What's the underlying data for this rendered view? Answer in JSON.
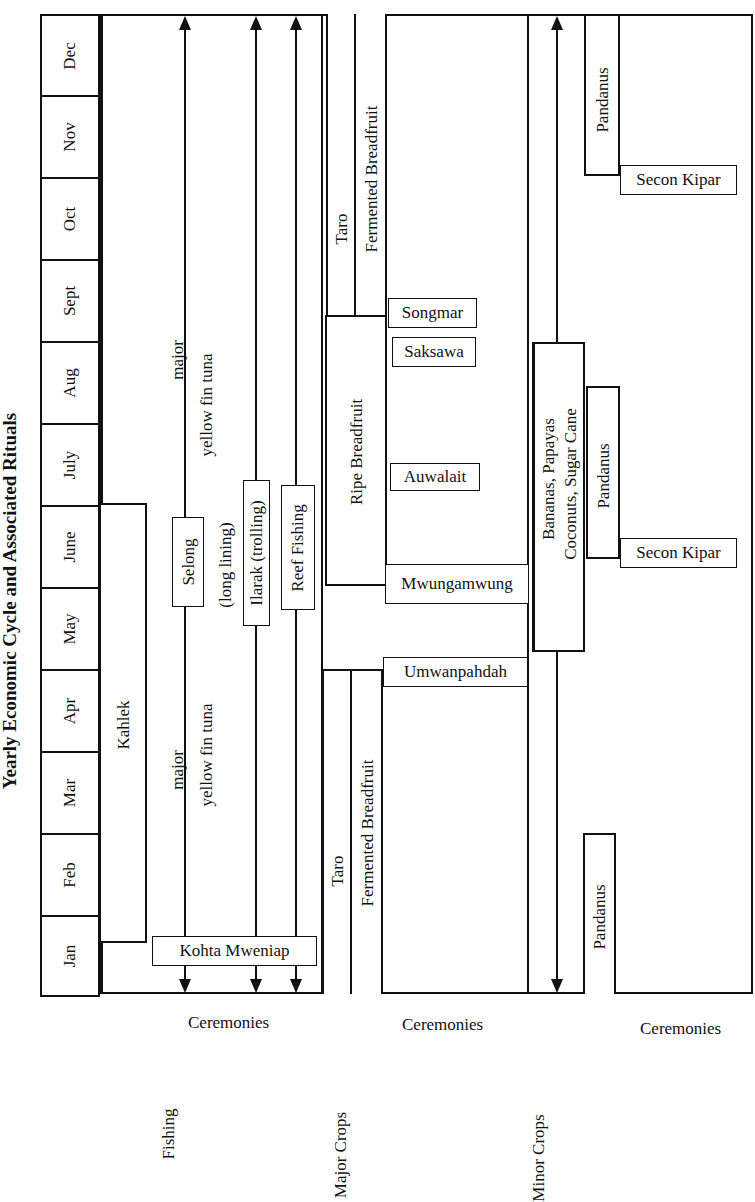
{
  "title": "Yearly Economic Cycle and Associated Rituals",
  "months": [
    "Dec",
    "Nov",
    "Oct",
    "Sept",
    "Aug",
    "July",
    "June",
    "May",
    "Apr",
    "Mar",
    "Feb",
    "Jan"
  ],
  "sections": {
    "fishing": {
      "label": "Fishing",
      "ceremonies_label": "Ceremonies",
      "kahlek": "Kahlek",
      "tuna_top_major": "major",
      "tuna_top_species": "yellow fin tuna",
      "tuna_bottom_major": "major",
      "tuna_bottom_species": "yellow fin tuna",
      "selong": "Selong",
      "selong_note": "(long lining)",
      "ilarak": "Ilarak (trolling)",
      "reef": "Reef Fishing",
      "ceremony": "Kohta Mweniap"
    },
    "major_crops": {
      "label": "Major Crops",
      "ceremonies_label": "Ceremonies",
      "taro_top": "Taro",
      "fermented_top": "Fermented Breadfruit",
      "ripe_breadfruit": "Ripe Breadfruit",
      "taro_bottom": "Taro",
      "fermented_bottom": "Fermented Breadfruit",
      "ceremonies": [
        "Songmar",
        "Saksawa",
        "Auwalait",
        "Mwungamwung",
        "Umwanpahdah"
      ]
    },
    "minor_crops": {
      "label": "Minor Crops",
      "ceremonies_label": "Ceremonies",
      "bananas_line1": "Bananas, Papayas",
      "bananas_line2": "Coconuts, Sugar Cane",
      "pandanus_top": "Pandanus",
      "pandanus_mid": "Pandanus",
      "pandanus_bottom": "Pandanus",
      "secon_kipar_top": "Secon Kipar",
      "secon_kipar_mid": "Secon Kipar"
    }
  }
}
